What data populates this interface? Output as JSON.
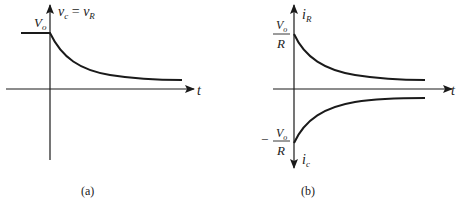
{
  "figure": {
    "panels": [
      {
        "id": "a",
        "caption": "(a)",
        "y_axis_label": "v_c = v_R",
        "y_axis_label_parts": {
          "v1": "v",
          "s1": "c",
          "eq": " = ",
          "v2": "v",
          "s2": "R"
        },
        "x_axis_label": "t",
        "level_label": {
          "main": "V",
          "sub": "o"
        },
        "curve": "constant V_o for t<0, exponential decay toward 0 for t>0"
      },
      {
        "id": "b",
        "caption": "(b)",
        "y_axis_top_label": {
          "main": "i",
          "sub": "R"
        },
        "y_axis_bottom_label": {
          "main": "i",
          "sub": "c"
        },
        "x_axis_label": "t",
        "top_value_label": {
          "num_main": "V",
          "num_sub": "o",
          "den": "R"
        },
        "bottom_value_label": {
          "sign": "−",
          "num_main": "V",
          "num_sub": "o",
          "den": "R"
        },
        "curves": [
          "i_R decays from V_o/R toward 0",
          "i_c rises from −V_o/R toward 0"
        ]
      }
    ]
  },
  "colors": {
    "line": "#1a1a1a",
    "text": "#222222",
    "background": "#ffffff"
  }
}
